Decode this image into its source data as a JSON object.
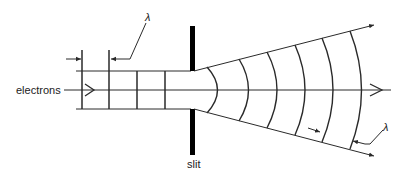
{
  "diagram": {
    "labels": {
      "electrons": "electrons",
      "slit": "slit",
      "wavelength_left": "λ",
      "wavelength_right": "λ"
    },
    "colors": {
      "line": "#2a2a2a",
      "slit": "#000000",
      "text": "#222222",
      "background": "#ffffff"
    },
    "incoming_wavefront_count": 4,
    "outgoing_wavefront_count": 6
  }
}
